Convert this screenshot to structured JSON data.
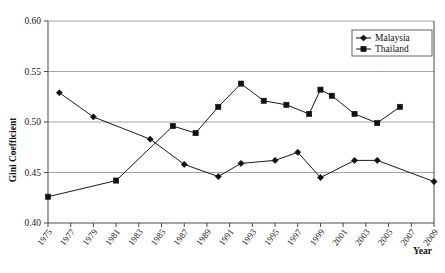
{
  "chart_data": {
    "type": "line",
    "title": "",
    "xlabel": "Year",
    "ylabel": "Gini Coefficient",
    "xlim": [
      1975,
      2009
    ],
    "ylim": [
      0.4,
      0.6
    ],
    "ytick_labels": [
      "0.60",
      "0.55",
      "0.50",
      "0.45",
      "0.40"
    ],
    "ytick_values": [
      0.6,
      0.55,
      0.5,
      0.45,
      0.4
    ],
    "xtick_labels": [
      "1975",
      "1977",
      "1979",
      "1981",
      "1983",
      "1985",
      "1987",
      "1989",
      "1991",
      "1993",
      "1995",
      "1997",
      "1999",
      "2001",
      "2003",
      "2005",
      "2007",
      "2009"
    ],
    "xtick_values": [
      1975,
      1977,
      1979,
      1981,
      1983,
      1985,
      1987,
      1989,
      1991,
      1993,
      1995,
      1997,
      1999,
      2001,
      2003,
      2005,
      2007,
      2009
    ],
    "grid": "horizontal",
    "legend_position": "top-right",
    "series": [
      {
        "name": "Malaysia",
        "marker": "diamond",
        "color": "#111111",
        "points": [
          {
            "x": 1976,
            "y": 0.529
          },
          {
            "x": 1979,
            "y": 0.505
          },
          {
            "x": 1984,
            "y": 0.483
          },
          {
            "x": 1987,
            "y": 0.458
          },
          {
            "x": 1990,
            "y": 0.446
          },
          {
            "x": 1992,
            "y": 0.459
          },
          {
            "x": 1995,
            "y": 0.462
          },
          {
            "x": 1997,
            "y": 0.47
          },
          {
            "x": 1999,
            "y": 0.445
          },
          {
            "x": 2002,
            "y": 0.462
          },
          {
            "x": 2004,
            "y": 0.462
          },
          {
            "x": 2009,
            "y": 0.441
          }
        ]
      },
      {
        "name": "Thailand",
        "marker": "square",
        "color": "#111111",
        "points": [
          {
            "x": 1975,
            "y": 0.426
          },
          {
            "x": 1981,
            "y": 0.442
          },
          {
            "x": 1986,
            "y": 0.496
          },
          {
            "x": 1988,
            "y": 0.489
          },
          {
            "x": 1990,
            "y": 0.515
          },
          {
            "x": 1992,
            "y": 0.538
          },
          {
            "x": 1994,
            "y": 0.521
          },
          {
            "x": 1996,
            "y": 0.517
          },
          {
            "x": 1998,
            "y": 0.508
          },
          {
            "x": 1999,
            "y": 0.532
          },
          {
            "x": 2000,
            "y": 0.526
          },
          {
            "x": 2002,
            "y": 0.508
          },
          {
            "x": 2004,
            "y": 0.499
          },
          {
            "x": 2006,
            "y": 0.515
          }
        ]
      }
    ]
  },
  "legend": {
    "items": [
      {
        "label": "Malaysia",
        "marker": "diamond"
      },
      {
        "label": "Thailand",
        "marker": "square"
      }
    ]
  }
}
